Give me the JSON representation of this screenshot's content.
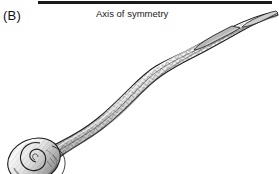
{
  "figure": {
    "panel_label": "(B)",
    "axis_caption": "Axis of symmetry",
    "background_color": "#ffffff",
    "ink_color": "#1a1a1a",
    "axis_bar": {
      "name": "axis-of-symmetry-bar",
      "color": "#1a1a1a",
      "x": 38,
      "y": 1,
      "width": 234,
      "height": 3
    },
    "specimen": {
      "name": "specimen-illustration",
      "description": "elongated sinuous skeletal element drawn in pen-and-ink line style",
      "proximal_end": "coiled bulbous knob at lower left",
      "distal_end": "tapering point at upper right",
      "shaft_texture": "chevron herringbone hatching",
      "outline_color": "#1a1a1a",
      "fill_color": "#fbfbfb",
      "shade_color": "#8e8e8e"
    }
  }
}
